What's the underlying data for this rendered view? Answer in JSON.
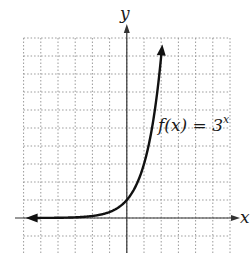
{
  "chart_data": {
    "type": "line",
    "title": "",
    "function_label": "f(x) = 3",
    "function_exponent": "x",
    "xlabel": "x",
    "ylabel": "y",
    "xlim": [
      -6,
      6
    ],
    "ylim": [
      -2,
      10
    ],
    "grid": true,
    "series": [
      {
        "name": "f(x) = 3^x",
        "x": [
          -5.5,
          -4,
          -3,
          -2,
          -1,
          0,
          0.5,
          1,
          1.5,
          2,
          2.05
        ],
        "y": [
          0.0024,
          0.0123,
          0.037,
          0.111,
          0.333,
          1,
          1.732,
          3,
          5.196,
          9,
          9.5
        ]
      }
    ]
  },
  "colors": {
    "grid": "#9a9a9a",
    "axis": "#333333",
    "curve": "#111111"
  }
}
